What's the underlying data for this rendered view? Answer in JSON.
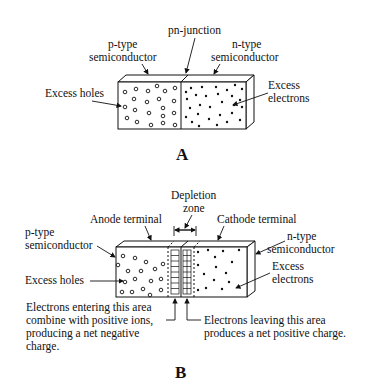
{
  "figure_a": {
    "caption": "A",
    "labels": {
      "p_type_line1": "p-type",
      "p_type_line2": "semiconductor",
      "pn_junction": "pn-junction",
      "n_type_line1": "n-type",
      "n_type_line2": "semiconductor",
      "excess_holes": "Excess holes",
      "excess_electrons_line1": "Excess",
      "excess_electrons_line2": "electrons"
    }
  },
  "figure_b": {
    "caption": "B",
    "labels": {
      "depletion_line1": "Depletion",
      "depletion_line2": "zone",
      "anode_terminal": "Anode terminal",
      "cathode_terminal": "Cathode terminal",
      "p_type_line1": "p-type",
      "p_type_line2": "semiconductor",
      "n_type_line1": "n-type",
      "n_type_line2": "semiconductor",
      "excess_holes": "Excess holes",
      "excess_electrons_line1": "Excess",
      "excess_electrons_line2": "electrons",
      "negative_note_line1": "Electrons entering this area",
      "negative_note_line2": "combine with positive ions,",
      "negative_note_line3": "producing a net negative",
      "negative_note_line4": "charge.",
      "positive_note_line1": "Electrons leaving this area",
      "positive_note_line2": "produces a net positive charge."
    }
  }
}
